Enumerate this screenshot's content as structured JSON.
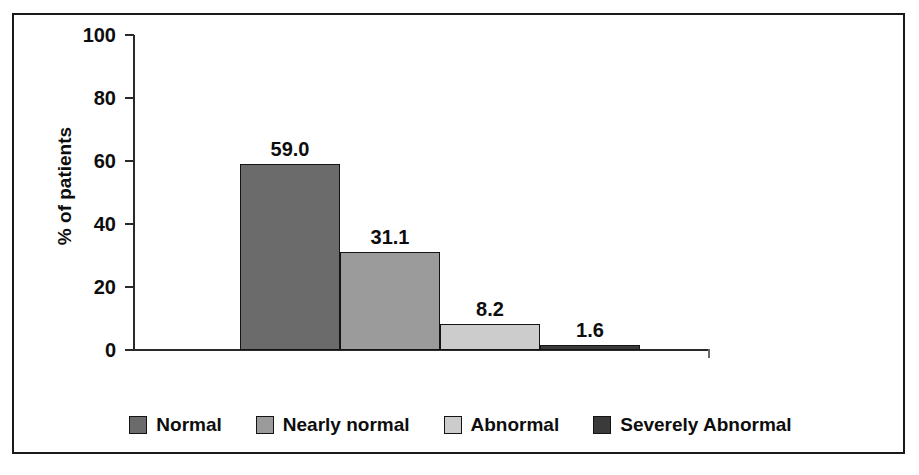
{
  "chart_data": {
    "type": "bar",
    "title": "",
    "subtitle": "",
    "xlabel": "",
    "ylabel": "% of patients",
    "categories": [
      "Normal",
      "Nearly normal",
      "Abnormal",
      "Severely Abnormal"
    ],
    "values": [
      59.0,
      31.1,
      8.2,
      1.6
    ],
    "value_labels": [
      "59.0",
      "31.1",
      "8.2",
      "1.6"
    ],
    "ylim": [
      0,
      100
    ],
    "yticks": [
      0,
      20,
      40,
      60,
      80,
      100
    ],
    "ytick_labels": [
      "0",
      "20",
      "40",
      "60",
      "80",
      "100"
    ],
    "xtick_labels": [],
    "grid": false,
    "legend_position": "bottom",
    "series": [
      {
        "name": "% of patients",
        "values": [
          59.0,
          31.1,
          8.2,
          1.6
        ]
      }
    ],
    "bar_colors": [
      "#6b6b6b",
      "#9b9b9b",
      "#cccccc",
      "#3a3a3a"
    ],
    "bar_edge_color": "#141414",
    "axis_color": "#2a2a2a",
    "frame_color": "#1a1a1a",
    "text_color": "#0d0d0d",
    "background": "#ffffff"
  },
  "legend": {
    "items": [
      {
        "label": "Normal",
        "color": "#6b6b6b"
      },
      {
        "label": "Nearly normal",
        "color": "#9b9b9b"
      },
      {
        "label": "Abnormal",
        "color": "#cccccc"
      },
      {
        "label": "Severely Abnormal",
        "color": "#3a3a3a"
      }
    ]
  }
}
